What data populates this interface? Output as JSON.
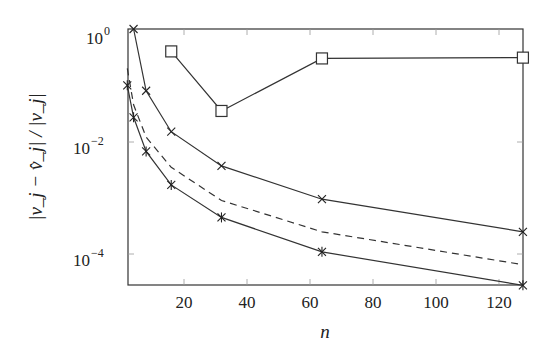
{
  "chart_data": {
    "type": "line",
    "title": "",
    "xlabel": "n",
    "ylabel": "|v_j − v̂_j| / |v_j|",
    "xscale": "linear",
    "yscale": "log",
    "xlim": [
      2,
      128
    ],
    "ylim": [
      2.8e-05,
      1.0
    ],
    "xticks": [
      20,
      40,
      60,
      80,
      100,
      120
    ],
    "xtick_labels": [
      "20",
      "40",
      "60",
      "80",
      "100",
      "120"
    ],
    "yticks": [
      1,
      0.01,
      0.0001
    ],
    "ytick_labels": [
      "10^0",
      "10^-2",
      "10^-4"
    ],
    "grid": false,
    "legend": null,
    "series": [
      {
        "name": "upper-x-markers",
        "marker": "x",
        "style": "solid",
        "x": [
          4,
          8,
          16,
          32,
          64,
          128
        ],
        "values": [
          1.0,
          0.08,
          0.015,
          0.0037,
          0.00095,
          0.00025
        ]
      },
      {
        "name": "lower-star-markers",
        "marker": "star",
        "style": "solid",
        "x": [
          2,
          4,
          8,
          16,
          32,
          64,
          128
        ],
        "values": [
          0.1,
          0.027,
          0.0067,
          0.0017,
          0.00045,
          0.00011,
          2.8e-05
        ]
      },
      {
        "name": "square-markers",
        "marker": "square",
        "style": "solid",
        "x": [
          16,
          32,
          64,
          128
        ],
        "values": [
          0.4,
          0.035,
          0.3,
          0.31
        ]
      },
      {
        "name": "dashed-reference",
        "marker": "none",
        "style": "dashed",
        "x": [
          2,
          4,
          8,
          16,
          32,
          64,
          128
        ],
        "values": [
          0.2,
          0.045,
          0.012,
          0.0035,
          0.0009,
          0.00025,
          6.5e-05
        ]
      }
    ]
  },
  "labels": {
    "xlabel": "n",
    "ytick_0": "10",
    "ytick_0_exp": "0",
    "ytick_2": "10",
    "ytick_2_exp": "−2",
    "ytick_4": "10",
    "ytick_4_exp": "−4",
    "xtick_20": "20",
    "xtick_40": "40",
    "xtick_60": "60",
    "xtick_80": "80",
    "xtick_100": "100",
    "xtick_120": "120"
  }
}
